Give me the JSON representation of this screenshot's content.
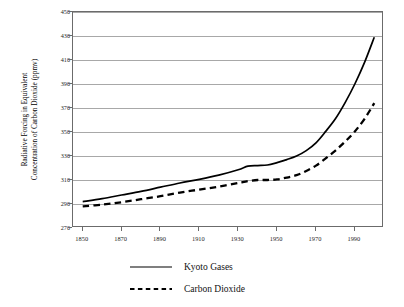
{
  "chart_data": {
    "type": "line",
    "title": "",
    "xlabel": "",
    "ylabel_lines": [
      "Radiative Forcing in Equivalent",
      "Concentration of Carbon Dioxide (ppmv)"
    ],
    "ylabel": "Radiative Forcing in Equivalent Concentration of Carbon Dioxide (ppmv)",
    "xlim": [
      1845,
      2005
    ],
    "ylim": [
      270,
      450
    ],
    "ytick_labels": [
      "450",
      "430",
      "410",
      "390",
      "370",
      "350",
      "330",
      "310",
      "290",
      "270"
    ],
    "ytick_values": [
      450,
      430,
      410,
      390,
      370,
      350,
      330,
      310,
      290,
      270
    ],
    "xtick_labels": [
      "1850",
      "1870",
      "1890",
      "1910",
      "1930",
      "1950",
      "1970",
      "1990"
    ],
    "xtick_values": [
      1850,
      1870,
      1890,
      1910,
      1930,
      1950,
      1970,
      1990
    ],
    "grid": true,
    "grid_axis": "y",
    "legend_position": "below-center",
    "x": [
      1850,
      1860,
      1870,
      1880,
      1890,
      1900,
      1910,
      1920,
      1930,
      1935,
      1940,
      1945,
      1950,
      1955,
      1960,
      1965,
      1970,
      1975,
      1980,
      1985,
      1990,
      1995,
      2000
    ],
    "series": [
      {
        "name": "Kyoto Gases",
        "style": "solid",
        "color": "#000000",
        "values": [
          292.0,
          294.5,
          297.5,
          300.5,
          304.0,
          307.5,
          310.5,
          314.0,
          318.5,
          321.5,
          322.0,
          322.5,
          324.5,
          327.0,
          330.0,
          334.5,
          341.0,
          350.5,
          361.0,
          374.5,
          390.0,
          408.0,
          429.0
        ]
      },
      {
        "name": "Carbon Dioxide",
        "style": "dashed",
        "color": "#000000",
        "values": [
          288.0,
          289.5,
          291.5,
          294.0,
          296.5,
          299.5,
          302.0,
          304.5,
          307.5,
          309.0,
          310.0,
          310.0,
          310.5,
          312.0,
          314.0,
          317.5,
          322.0,
          328.0,
          334.5,
          342.0,
          350.5,
          361.0,
          374.0
        ]
      }
    ]
  },
  "legend": {
    "items": [
      {
        "label": "Kyoto Gases",
        "style": "solid"
      },
      {
        "label": "Carbon Dioxide",
        "style": "dashed"
      }
    ]
  }
}
